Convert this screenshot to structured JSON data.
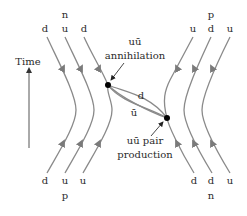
{
  "diagram": {
    "type": "feynman-quark-flow",
    "axis": {
      "label": "Time",
      "direction": "up"
    },
    "colors": {
      "quark_line": "#8a8a8a",
      "text": "#2a2a2a",
      "vertex": "#000000"
    },
    "top_left": {
      "particle": "n",
      "quarks": [
        "d",
        "u",
        "d"
      ]
    },
    "top_right": {
      "particle": "p",
      "quarks": [
        "u",
        "d",
        "u"
      ]
    },
    "bottom_left": {
      "particle": "p",
      "quarks": [
        "d",
        "u",
        "u"
      ]
    },
    "bottom_right": {
      "particle": "n",
      "quarks": [
        "d",
        "d",
        "u"
      ]
    },
    "exchange": {
      "quark": "d",
      "antiquark": "ū"
    },
    "annihilation": {
      "line1": "uū",
      "line2": "annihilation"
    },
    "pair_production": {
      "line1": "uū pair",
      "line2": "production"
    }
  }
}
